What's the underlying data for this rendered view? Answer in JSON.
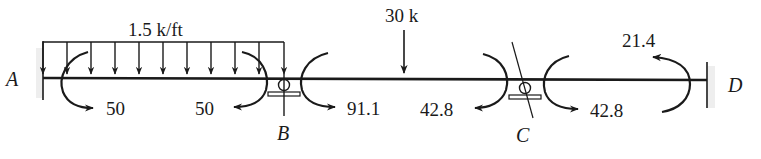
{
  "diagram": {
    "nodes": [
      {
        "id": "A",
        "label": "A",
        "support": "fixed",
        "x": 43
      },
      {
        "id": "B",
        "label": "B",
        "support": "roller",
        "x": 283
      },
      {
        "id": "C",
        "label": "C",
        "support": "roller",
        "x": 523
      },
      {
        "id": "D",
        "label": "D",
        "support": "fixed",
        "x": 707
      }
    ],
    "loads": {
      "distributed": {
        "label": "1.5 k/ft",
        "span": "A-B"
      },
      "point": {
        "label": "30 k",
        "span": "B-C"
      }
    },
    "moments": [
      {
        "id": "m-a-right",
        "label": "50",
        "location": "near A, span AB",
        "direction": "clockwise"
      },
      {
        "id": "m-b-left",
        "label": "50",
        "location": "near B, span AB",
        "direction": "counterclockwise"
      },
      {
        "id": "m-b-right",
        "label": "91.1",
        "location": "near B, span BC",
        "direction": "counterclockwise"
      },
      {
        "id": "m-c-left",
        "label": "42.8",
        "location": "near C, span BC",
        "direction": "clockwise"
      },
      {
        "id": "m-c-right",
        "label": "42.8",
        "location": "near C, span CD",
        "direction": "counterclockwise"
      },
      {
        "id": "m-d-left",
        "label": "21.4",
        "location": "near D, span CD",
        "direction": "clockwise"
      }
    ],
    "colors": {
      "ink": "#1a1a1a",
      "background": "#ffffff"
    }
  }
}
